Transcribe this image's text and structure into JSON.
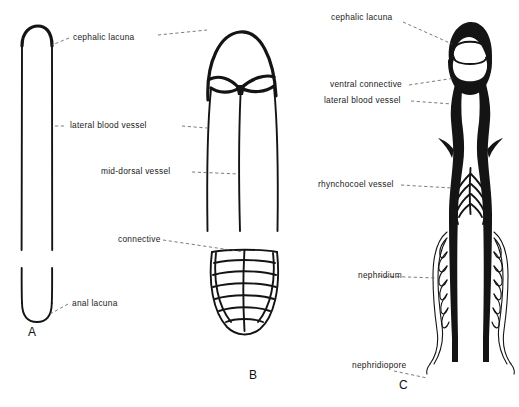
{
  "figure": {
    "type": "anatomical-diagram",
    "background_color": "#ffffff",
    "ink_color": "#141414",
    "leader_color": "#5a5a5a"
  },
  "panels": [
    {
      "id": "A",
      "caption": "A",
      "labels": [
        {
          "key": "cephalic_lacuna",
          "text": "cephalic lacuna"
        },
        {
          "key": "anal_lacuna",
          "text": "anal lacuna"
        }
      ]
    },
    {
      "id": "B",
      "caption": "B",
      "labels": [
        {
          "key": "lateral_blood_vessel",
          "text": "lateral blood vessel"
        },
        {
          "key": "mid_dorsal_vessel",
          "text": "mid-dorsal vessel"
        },
        {
          "key": "connective",
          "text": "connective"
        }
      ]
    },
    {
      "id": "C",
      "caption": "C",
      "labels": [
        {
          "key": "cephalic_lacuna",
          "text": "cephalic lacuna"
        },
        {
          "key": "ventral_connective",
          "text": "ventral connective"
        },
        {
          "key": "lateral_blood_vessel",
          "text": "lateral blood vessel"
        },
        {
          "key": "rhynchocoel_vessel",
          "text": "rhynchocoel vessel"
        },
        {
          "key": "nephridium",
          "text": "nephridium"
        },
        {
          "key": "nephridiopore",
          "text": "nephridiopore"
        }
      ]
    }
  ],
  "labels": {
    "cephalic_lacuna_a": "cephalic lacuna",
    "lateral_blood_vessel_a": "lateral blood vessel",
    "mid_dorsal_vessel_b": "mid-dorsal vessel",
    "connective_b": "connective",
    "anal_lacuna_a": "anal lacuna",
    "cephalic_lacuna_c": "cephalic lacuna",
    "ventral_connective_c": "ventral connective",
    "lateral_blood_vessel_c": "lateral blood vessel",
    "rhynchocoel_vessel_c": "rhynchocoel vessel",
    "nephridium_c": "nephridium",
    "nephridiopore_c": "nephridiopore"
  },
  "captions": {
    "a": "A",
    "b": "B",
    "c": "C"
  }
}
